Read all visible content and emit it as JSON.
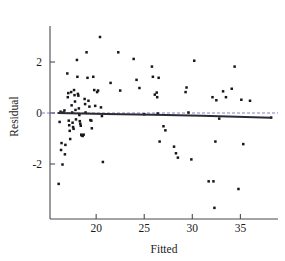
{
  "figure": {
    "background_color": "#ffffff",
    "point_color": "#16161c",
    "line_color": "#2b2b33",
    "axis_color": "#4a4a52"
  },
  "chart_data": {
    "type": "scatter",
    "title": "",
    "subtitle": "",
    "xlabel": "Fitted",
    "ylabel": "Residual",
    "xlim": [
      15.2,
      38.6
    ],
    "ylim": [
      -4.3,
      3.4
    ],
    "xticks": [
      20,
      25,
      30,
      35
    ],
    "xtick_labels": [
      "20",
      "25",
      "30",
      "35"
    ],
    "yticks": [
      2,
      0,
      -2
    ],
    "ytick_labels": [
      "2",
      "0",
      "-2"
    ],
    "grid": false,
    "legend": null,
    "annotations": [],
    "reference_lines": [
      {
        "name": "zero-residual-line",
        "orientation": "horizontal",
        "value": 0,
        "style": "dashed",
        "color": "#5a5ab0"
      }
    ],
    "fit_line": {
      "name": "lowess-fit-line",
      "x": [
        16.0,
        21.0,
        26.0,
        31.0,
        38.2
      ],
      "y": [
        0.0,
        -0.04,
        -0.07,
        -0.11,
        -0.19
      ],
      "color": "#2b2b33"
    },
    "points": [
      [
        16.1,
        -2.78
      ],
      [
        16.2,
        -0.35
      ],
      [
        16.3,
        0.05
      ],
      [
        16.35,
        -1.45
      ],
      [
        16.4,
        -1.18
      ],
      [
        16.5,
        -2.02
      ],
      [
        16.6,
        0.02
      ],
      [
        16.7,
        0.1
      ],
      [
        16.75,
        -1.62
      ],
      [
        16.8,
        -1.25
      ],
      [
        17.0,
        1.55
      ],
      [
        17.05,
        0.62
      ],
      [
        17.1,
        0.78
      ],
      [
        17.15,
        -0.3
      ],
      [
        17.2,
        -0.48
      ],
      [
        17.25,
        -0.7
      ],
      [
        17.3,
        -1.02
      ],
      [
        17.4,
        0.82
      ],
      [
        17.45,
        0.3
      ],
      [
        17.5,
        0.02
      ],
      [
        17.55,
        -0.38
      ],
      [
        17.6,
        -0.55
      ],
      [
        17.65,
        -0.62
      ],
      [
        17.7,
        0.9
      ],
      [
        17.75,
        0.7
      ],
      [
        17.8,
        0.45
      ],
      [
        17.85,
        0.12
      ],
      [
        17.9,
        -0.25
      ],
      [
        18.0,
        2.08
      ],
      [
        18.05,
        1.42
      ],
      [
        18.1,
        0.75
      ],
      [
        18.15,
        0.68
      ],
      [
        18.2,
        0.18
      ],
      [
        18.25,
        -0.08
      ],
      [
        18.3,
        -0.32
      ],
      [
        18.35,
        -0.42
      ],
      [
        18.4,
        -0.5
      ],
      [
        18.45,
        -0.85
      ],
      [
        18.5,
        -0.88
      ],
      [
        18.6,
        -0.9
      ],
      [
        18.7,
        -0.85
      ],
      [
        18.8,
        0.55
      ],
      [
        18.85,
        0.35
      ],
      [
        18.9,
        0.02
      ],
      [
        19.0,
        2.38
      ],
      [
        19.1,
        1.38
      ],
      [
        19.2,
        0.48
      ],
      [
        19.3,
        0.25
      ],
      [
        19.4,
        -0.28
      ],
      [
        19.5,
        -0.3
      ],
      [
        19.55,
        -0.6
      ],
      [
        19.7,
        1.42
      ],
      [
        19.8,
        0.9
      ],
      [
        19.9,
        0.28
      ],
      [
        20.1,
        0.82
      ],
      [
        20.2,
        0.88
      ],
      [
        20.4,
        2.98
      ],
      [
        20.5,
        0.22
      ],
      [
        20.6,
        -0.12
      ],
      [
        20.7,
        -1.92
      ],
      [
        21.5,
        1.18
      ],
      [
        22.3,
        2.38
      ],
      [
        22.5,
        0.88
      ],
      [
        23.9,
        2.12
      ],
      [
        24.2,
        1.3
      ],
      [
        24.5,
        0.98
      ],
      [
        25.0,
        -0.05
      ],
      [
        25.8,
        1.82
      ],
      [
        25.9,
        1.42
      ],
      [
        26.1,
        0.72
      ],
      [
        26.3,
        0.8
      ],
      [
        26.35,
        0.62
      ],
      [
        26.4,
        -0.02
      ],
      [
        26.5,
        1.38
      ],
      [
        26.6,
        -1.12
      ],
      [
        27.0,
        -0.52
      ],
      [
        27.2,
        -0.68
      ],
      [
        28.1,
        -1.32
      ],
      [
        28.3,
        -1.58
      ],
      [
        28.5,
        -1.75
      ],
      [
        29.3,
        0.82
      ],
      [
        29.4,
        1.0
      ],
      [
        29.6,
        0.02
      ],
      [
        29.9,
        -1.82
      ],
      [
        30.2,
        2.05
      ],
      [
        31.7,
        -2.68
      ],
      [
        32.1,
        0.62
      ],
      [
        32.2,
        -2.68
      ],
      [
        32.3,
        -3.72
      ],
      [
        32.4,
        -1.12
      ],
      [
        32.5,
        0.5
      ],
      [
        32.8,
        -0.22
      ],
      [
        33.2,
        0.85
      ],
      [
        33.5,
        0.62
      ],
      [
        34.1,
        0.95
      ],
      [
        34.4,
        1.82
      ],
      [
        34.8,
        -2.98
      ],
      [
        35.1,
        0.52
      ],
      [
        35.3,
        -1.22
      ],
      [
        36.0,
        0.48
      ],
      [
        38.2,
        -0.18
      ]
    ]
  }
}
